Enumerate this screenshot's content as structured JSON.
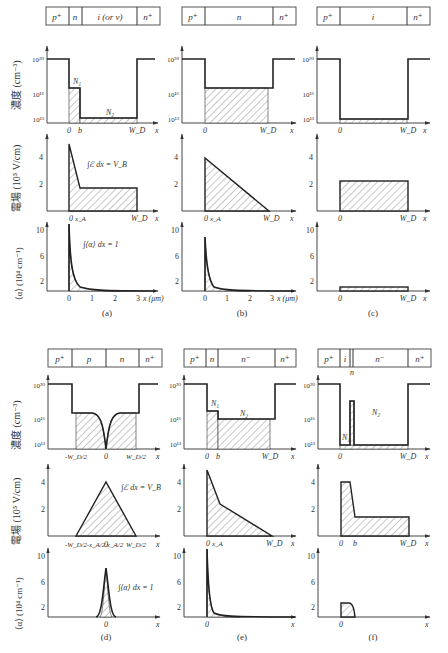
{
  "figure": {
    "y_axis_labels": {
      "concentration": "濃度 (cm⁻³)",
      "field": "電場 (10⁵ V/cm)",
      "ionization": "⟨α⟩ (10⁴ cm⁻¹)"
    },
    "concentration_ticks": [
      "10²⁰",
      "10¹⁶",
      "10¹³"
    ],
    "field_ticks": [
      "4",
      "2"
    ],
    "alpha_ticks": [
      "10",
      "6",
      "2"
    ],
    "x_symbol": "x",
    "panels": [
      {
        "id": "a",
        "caption": "(a)",
        "layers": [
          "p⁺",
          "n",
          "i (or ν)",
          "n⁺"
        ],
        "concentration_labels": [
          "N₁",
          "N₂"
        ],
        "concentration_x_ticks": [
          "0",
          "b",
          "W_D"
        ],
        "field_x_ticks": [
          "0",
          "x_A",
          "W_D"
        ],
        "field_annotation": "∫ℰ dx = V_B",
        "alpha_annotation": "∫⟨α⟩ dx = 1",
        "alpha_x_ticks": [
          "0",
          "1",
          "2",
          "3"
        ],
        "alpha_x_label": "x (μm)"
      },
      {
        "id": "b",
        "caption": "(b)",
        "layers": [
          "p⁺",
          "n",
          "n⁺"
        ],
        "concentration_x_ticks": [
          "0",
          "W_D"
        ],
        "field_x_ticks": [
          "0",
          "x_A",
          "W_D"
        ],
        "alpha_x_ticks": [
          "0",
          "1",
          "2",
          "3"
        ],
        "alpha_x_label": "x (μm)"
      },
      {
        "id": "c",
        "caption": "(c)",
        "layers": [
          "p⁺",
          "i",
          "n⁺"
        ],
        "concentration_x_ticks": [
          "0",
          "W_D"
        ],
        "field_x_ticks": [
          "0",
          "W_D"
        ],
        "alpha_x_ticks": [
          "0",
          "W_D"
        ]
      },
      {
        "id": "d",
        "caption": "(d)",
        "layers": [
          "p⁺",
          "p",
          "n",
          "n⁺"
        ],
        "concentration_x_ticks": [
          "-W_D/2",
          "0",
          "W_D/2"
        ],
        "field_x_ticks": [
          "-W_D/2",
          "-x_A/2",
          "0",
          "x_A/2",
          "W_D/2"
        ],
        "field_annotation": "∫ℰ dx = V_B",
        "alpha_annotation": "∫⟨α⟩ dx = 1",
        "alpha_x_ticks": [
          "0"
        ]
      },
      {
        "id": "e",
        "caption": "(e)",
        "layers": [
          "p⁺",
          "n",
          "n⁻",
          "n⁺"
        ],
        "concentration_labels": [
          "N₁",
          "N₂"
        ],
        "concentration_x_ticks": [
          "0",
          "b",
          "W_D"
        ],
        "field_x_ticks": [
          "0",
          "x_A",
          "W_D"
        ],
        "alpha_x_ticks": [
          "0"
        ]
      },
      {
        "id": "f",
        "caption": "(f)",
        "layers": [
          "p⁺",
          "i",
          "n",
          "n⁻",
          "n⁺"
        ],
        "concentration_labels": [
          "N₁",
          "N₂"
        ],
        "concentration_x_ticks": [
          "0",
          "W_D"
        ],
        "field_x_ticks": [
          "0",
          "b",
          "W_D"
        ],
        "alpha_x_ticks": [
          "0"
        ]
      }
    ]
  }
}
